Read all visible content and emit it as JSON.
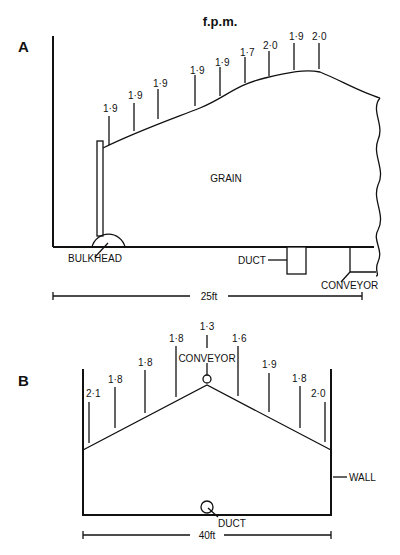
{
  "title": "f.p.m.",
  "diagram_a": {
    "label": "A",
    "readings": [
      "1·9",
      "1·9",
      "1·9",
      "1·9",
      "1·9",
      "1·7",
      "2·0",
      "1·9",
      "2·0"
    ],
    "grain_label": "GRAIN",
    "bulkhead_label": "BULKHEAD",
    "duct_label": "DUCT",
    "conveyor_label": "CONVEYOR",
    "dimension": "25ft"
  },
  "diagram_b": {
    "label": "B",
    "readings_left": [
      "2·1",
      "1·8",
      "1·8",
      "1·8"
    ],
    "reading_top": "1·3",
    "readings_right": [
      "1·6",
      "1·9",
      "1·8",
      "2·0"
    ],
    "conveyor_label": "CONVEYOR",
    "wall_label": "WALL",
    "duct_label": "DUCT",
    "dimension": "40ft"
  }
}
